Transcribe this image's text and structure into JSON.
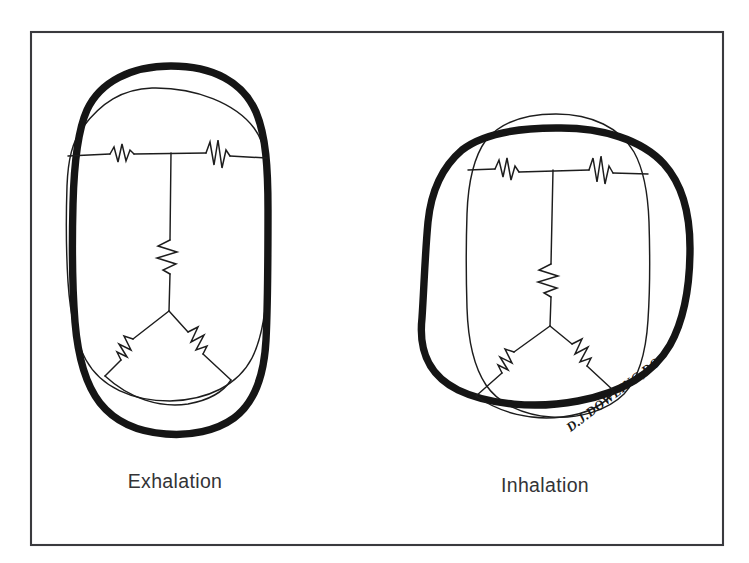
{
  "canvas": {
    "width": 749,
    "height": 563,
    "background_color": "#ffffff"
  },
  "frame": {
    "stroke_color": "#3a3a3e",
    "x": 31,
    "y": 32,
    "width": 692,
    "height": 513
  },
  "diagram": {
    "title_visible": false,
    "ink_color": "#151515",
    "thin_ink_color": "#1d1d1d"
  },
  "panels": [
    {
      "id": "exhalation",
      "caption": "Exhalation",
      "caption_x": 175,
      "caption_y": 488,
      "bold_shape": "tall-narrow-oval",
      "thin_shape": "wider-rounded-rectangle",
      "springs": {
        "horizontal_count": 2,
        "vertical_count": 1,
        "diagonal_count": 2
      }
    },
    {
      "id": "inhalation",
      "caption": "Inhalation",
      "caption_x": 545,
      "caption_y": 492,
      "bold_shape": "wide-rounded-square",
      "thin_shape": "taller-narrow-oval",
      "springs": {
        "horizontal_count": 2,
        "vertical_count": 1,
        "diagonal_count": 2
      }
    }
  ],
  "signature": {
    "text": "D.J.DOWLING,DO",
    "x": 616,
    "y": 398,
    "rotation_deg": -37
  },
  "captions": {
    "left": "Exhalation",
    "right": "Inhalation"
  }
}
